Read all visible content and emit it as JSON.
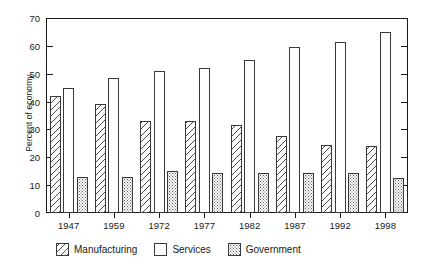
{
  "chart_data": {
    "type": "bar",
    "title": "",
    "subtitle": "",
    "xlabel": "",
    "ylabel": "Percent of economy",
    "ylim": [
      0,
      70
    ],
    "ytick_step": 10,
    "yticks": [
      0,
      10,
      20,
      30,
      40,
      50,
      60,
      70
    ],
    "grid": false,
    "legend_position": "bottom",
    "categories": [
      "1947",
      "1959",
      "1972",
      "1977",
      "1982",
      "1987",
      "1992",
      "1998"
    ],
    "series": [
      {
        "name": "Manufacturing",
        "pattern": "diagonal-hatch",
        "values": [
          42,
          39,
          33,
          33,
          31.5,
          27.5,
          24.5,
          24
        ]
      },
      {
        "name": "Services",
        "pattern": "solid-white",
        "values": [
          45,
          48.5,
          51,
          52,
          55,
          59.5,
          61.5,
          65
        ]
      },
      {
        "name": "Government",
        "pattern": "stipple-dots",
        "values": [
          13,
          13,
          15,
          14.5,
          14.5,
          14.5,
          14.5,
          12.5
        ]
      }
    ],
    "colors": {
      "axis": "#1a1a1a",
      "bar_outline": "#3a3a3a",
      "hatch": "#4a4a4a",
      "dots": "#595959",
      "background": "#ffffff"
    }
  }
}
